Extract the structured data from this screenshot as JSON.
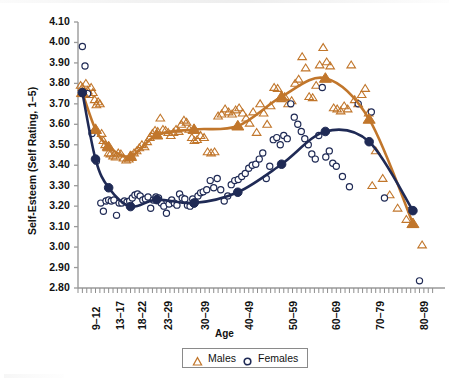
{
  "chart_data": {
    "type": "scatter",
    "title": "",
    "xlabel": "Age",
    "ylabel": "Self-Esteem (Self Rating, 1–5)",
    "ylim": [
      2.8,
      4.1
    ],
    "ystep": 0.1,
    "ytick_labels": [
      "4.10",
      "4.00",
      "3.90",
      "3.80",
      "3.70",
      "3.60",
      "3.50",
      "3.40",
      "3.30",
      "3.20",
      "3.10",
      "3.00",
      "2.90",
      "2.80"
    ],
    "ytick_values": [
      4.1,
      4.0,
      3.9,
      3.8,
      3.7,
      3.6,
      3.5,
      3.4,
      3.3,
      3.2,
      3.1,
      3.0,
      2.9,
      2.8
    ],
    "categories": [
      "9–12",
      "13–17",
      "18–22",
      "23–29",
      "30–39",
      "40–49",
      "50–59",
      "60–69",
      "70–79",
      "80–89"
    ],
    "category_x": [
      9.5,
      15,
      20,
      26,
      34.5,
      44.5,
      54.5,
      64.5,
      74.5,
      84.5
    ],
    "xlim": [
      8,
      90
    ],
    "grid": false,
    "legend_position": "bottom",
    "series": [
      {
        "name": "Males",
        "marker": "triangle-open",
        "color": "#C1762B",
        "trend": {
          "x": [
            9,
            12,
            15,
            20,
            26,
            34.5,
            44.5,
            54.5,
            64.5,
            74.5,
            84.5
          ],
          "y": [
            3.755,
            3.575,
            3.49,
            3.443,
            3.548,
            3.575,
            3.592,
            3.735,
            3.825,
            3.625,
            3.115
          ]
        },
        "points": [
          [
            8.6,
            3.79
          ],
          [
            9.0,
            3.78
          ],
          [
            9.4,
            3.755
          ],
          [
            9.8,
            3.8
          ],
          [
            10.2,
            3.765
          ],
          [
            10.6,
            3.745
          ],
          [
            11.0,
            3.78
          ],
          [
            11.4,
            3.755
          ],
          [
            11.8,
            3.72
          ],
          [
            12.2,
            3.695
          ],
          [
            12.6,
            3.71
          ],
          [
            13.0,
            3.7
          ],
          [
            13.4,
            3.555
          ],
          [
            13.8,
            3.52
          ],
          [
            14.2,
            3.5
          ],
          [
            14.6,
            3.49
          ],
          [
            15.0,
            3.46
          ],
          [
            15.4,
            3.455
          ],
          [
            16.0,
            3.445
          ],
          [
            16.6,
            3.44
          ],
          [
            17.2,
            3.46
          ],
          [
            17.8,
            3.455
          ],
          [
            18.4,
            3.435
          ],
          [
            19.0,
            3.425
          ],
          [
            19.6,
            3.43
          ],
          [
            20.2,
            3.445
          ],
          [
            20.8,
            3.46
          ],
          [
            21.4,
            3.47
          ],
          [
            22.0,
            3.485
          ],
          [
            22.6,
            3.5
          ],
          [
            23.2,
            3.49
          ],
          [
            23.8,
            3.515
          ],
          [
            24.4,
            3.535
          ],
          [
            25.0,
            3.555
          ],
          [
            25.6,
            3.57
          ],
          [
            26.2,
            3.565
          ],
          [
            26.8,
            3.63
          ],
          [
            27.4,
            3.575
          ],
          [
            28.0,
            3.57
          ],
          [
            28.6,
            3.56
          ],
          [
            29.2,
            3.545
          ],
          [
            29.8,
            3.56
          ],
          [
            30.4,
            3.575
          ],
          [
            31.0,
            3.565
          ],
          [
            31.6,
            3.6
          ],
          [
            32.2,
            3.62
          ],
          [
            32.8,
            3.61
          ],
          [
            33.4,
            3.575
          ],
          [
            34.0,
            3.535
          ],
          [
            34.6,
            3.52
          ],
          [
            35.2,
            3.525
          ],
          [
            36.0,
            3.545
          ],
          [
            36.8,
            3.535
          ],
          [
            37.6,
            3.465
          ],
          [
            38.4,
            3.46
          ],
          [
            39.2,
            3.465
          ],
          [
            40.0,
            3.64
          ],
          [
            40.8,
            3.65
          ],
          [
            41.6,
            3.675
          ],
          [
            42.4,
            3.66
          ],
          [
            43.2,
            3.65
          ],
          [
            44.0,
            3.67
          ],
          [
            44.8,
            3.68
          ],
          [
            45.6,
            3.655
          ],
          [
            46.4,
            3.63
          ],
          [
            47.2,
            3.605
          ],
          [
            48.0,
            3.66
          ],
          [
            48.8,
            3.56
          ],
          [
            49.6,
            3.7
          ],
          [
            50.4,
            3.655
          ],
          [
            51.2,
            3.6
          ],
          [
            52.0,
            3.69
          ],
          [
            52.8,
            3.78
          ],
          [
            53.6,
            3.775
          ],
          [
            54.4,
            3.725
          ],
          [
            55.2,
            3.735
          ],
          [
            56.0,
            3.7
          ],
          [
            56.8,
            3.715
          ],
          [
            57.6,
            3.8
          ],
          [
            58.4,
            3.82
          ],
          [
            59.2,
            3.93
          ],
          [
            60.0,
            3.875
          ],
          [
            60.8,
            3.735
          ],
          [
            61.6,
            3.73
          ],
          [
            62.4,
            3.79
          ],
          [
            63.2,
            3.89
          ],
          [
            64.0,
            3.975
          ],
          [
            64.8,
            3.905
          ],
          [
            65.6,
            3.885
          ],
          [
            66.4,
            3.68
          ],
          [
            67.2,
            3.675
          ],
          [
            68.0,
            3.665
          ],
          [
            68.8,
            3.69
          ],
          [
            69.6,
            3.675
          ],
          [
            70.4,
            3.89
          ],
          [
            71.2,
            3.72
          ],
          [
            72.0,
            3.7
          ],
          [
            72.8,
            3.745
          ],
          [
            73.6,
            3.775
          ],
          [
            74.4,
            3.655
          ],
          [
            75.2,
            3.3
          ],
          [
            76.0,
            3.47
          ],
          [
            77.6,
            3.335
          ],
          [
            79.2,
            3.255
          ],
          [
            81.0,
            3.19
          ],
          [
            83.0,
            3.135
          ],
          [
            84.4,
            3.11
          ],
          [
            86.6,
            3.01
          ]
        ]
      },
      {
        "name": "Females",
        "marker": "circle-open",
        "color": "#1F2A55",
        "trend": {
          "x": [
            9,
            12,
            15,
            20,
            26,
            34.5,
            44.5,
            54.5,
            64.5,
            74.5,
            84.5
          ],
          "y": [
            3.755,
            3.43,
            3.29,
            3.198,
            3.232,
            3.215,
            3.268,
            3.405,
            3.565,
            3.515,
            3.178
          ]
        },
        "points": [
          [
            9.0,
            3.98
          ],
          [
            9.6,
            3.885
          ],
          [
            10.2,
            3.75
          ],
          [
            11.2,
            3.555
          ],
          [
            12.2,
            3.42
          ],
          [
            13.2,
            3.215
          ],
          [
            13.8,
            3.175
          ],
          [
            14.4,
            3.225
          ],
          [
            15.0,
            3.23
          ],
          [
            15.6,
            3.225
          ],
          [
            16.2,
            3.23
          ],
          [
            16.8,
            3.155
          ],
          [
            17.4,
            3.215
          ],
          [
            18.0,
            3.215
          ],
          [
            18.6,
            3.225
          ],
          [
            19.2,
            3.22
          ],
          [
            19.8,
            3.225
          ],
          [
            20.4,
            3.24
          ],
          [
            21.0,
            3.255
          ],
          [
            21.6,
            3.26
          ],
          [
            22.2,
            3.25
          ],
          [
            22.8,
            3.23
          ],
          [
            23.4,
            3.235
          ],
          [
            24.0,
            3.245
          ],
          [
            24.6,
            3.19
          ],
          [
            25.2,
            3.23
          ],
          [
            25.8,
            3.245
          ],
          [
            26.4,
            3.24
          ],
          [
            27.0,
            3.215
          ],
          [
            27.6,
            3.2
          ],
          [
            28.2,
            3.165
          ],
          [
            28.8,
            3.21
          ],
          [
            29.4,
            3.23
          ],
          [
            30.0,
            3.215
          ],
          [
            30.6,
            3.205
          ],
          [
            31.2,
            3.26
          ],
          [
            31.8,
            3.24
          ],
          [
            32.4,
            3.235
          ],
          [
            33.0,
            3.205
          ],
          [
            33.6,
            3.2
          ],
          [
            34.2,
            3.235
          ],
          [
            34.8,
            3.22
          ],
          [
            35.4,
            3.25
          ],
          [
            36.0,
            3.265
          ],
          [
            36.6,
            3.27
          ],
          [
            37.4,
            3.28
          ],
          [
            38.2,
            3.325
          ],
          [
            39.0,
            3.29
          ],
          [
            39.8,
            3.335
          ],
          [
            40.6,
            3.28
          ],
          [
            41.4,
            3.225
          ],
          [
            42.2,
            3.25
          ],
          [
            43.0,
            3.305
          ],
          [
            43.8,
            3.325
          ],
          [
            44.6,
            3.33
          ],
          [
            45.4,
            3.345
          ],
          [
            46.2,
            3.36
          ],
          [
            47.0,
            3.385
          ],
          [
            47.8,
            3.4
          ],
          [
            48.6,
            3.405
          ],
          [
            49.4,
            3.43
          ],
          [
            50.2,
            3.46
          ],
          [
            51.0,
            3.335
          ],
          [
            51.8,
            3.395
          ],
          [
            52.6,
            3.525
          ],
          [
            53.4,
            3.535
          ],
          [
            54.2,
            3.5
          ],
          [
            55.0,
            3.545
          ],
          [
            55.8,
            3.53
          ],
          [
            56.6,
            3.7
          ],
          [
            57.4,
            3.635
          ],
          [
            58.2,
            3.6
          ],
          [
            59.0,
            3.565
          ],
          [
            59.8,
            3.53
          ],
          [
            60.6,
            3.5
          ],
          [
            61.4,
            3.455
          ],
          [
            62.2,
            3.43
          ],
          [
            63.0,
            3.545
          ],
          [
            63.8,
            3.78
          ],
          [
            64.6,
            3.44
          ],
          [
            65.4,
            3.47
          ],
          [
            66.2,
            3.41
          ],
          [
            67.0,
            3.395
          ],
          [
            68.4,
            3.345
          ],
          [
            70.0,
            3.295
          ],
          [
            72.0,
            3.7
          ],
          [
            75.0,
            3.66
          ],
          [
            78.0,
            3.24
          ],
          [
            84.0,
            3.18
          ],
          [
            86.0,
            2.835
          ]
        ]
      }
    ]
  },
  "legend": {
    "items": [
      {
        "label": "Males",
        "marker": "triangle-open",
        "color": "#C1762B"
      },
      {
        "label": "Females",
        "marker": "circle-open",
        "color": "#1F2A55"
      }
    ]
  },
  "axes": {
    "y_title": "Self-Esteem (Self Rating, 1–5)",
    "x_title": "Age"
  }
}
